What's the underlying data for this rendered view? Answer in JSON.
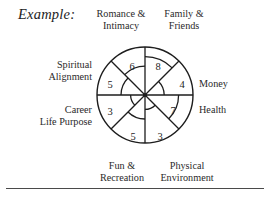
{
  "figure": {
    "caption_prefix": "Example:"
  },
  "chart_data": {
    "type": "pie",
    "subtype": "radar-wheel / life-balance wheel",
    "scale_min": 0,
    "scale_max": 10,
    "grid": false,
    "legend": "none",
    "categories": [
      "Family & Friends",
      "Money",
      "Health",
      "Physical Environment",
      "Fun & Recreation",
      "Career Life Purpose",
      "Spiritual Alignment",
      "Romance & Intimacy"
    ],
    "values": [
      8,
      4,
      7,
      3,
      5,
      3,
      5,
      6
    ],
    "segments": [
      {
        "id": "family-friends",
        "label": "Family &\nFriends",
        "label_line1": "Family &",
        "label_line2": "Friends",
        "value": 8,
        "value_text": "8",
        "start_deg": -90,
        "end_deg": -45
      },
      {
        "id": "money",
        "label": "Money",
        "label_line1": "Money",
        "label_line2": "",
        "value": 4,
        "value_text": "4",
        "start_deg": -45,
        "end_deg": 0
      },
      {
        "id": "health",
        "label": "Health",
        "label_line1": "Health",
        "label_line2": "",
        "value": 7,
        "value_text": "7",
        "start_deg": 0,
        "end_deg": 45
      },
      {
        "id": "physical-environment",
        "label": "Physical\nEnvironment",
        "label_line1": "Physical",
        "label_line2": "Environment",
        "value": 3,
        "value_text": "3",
        "start_deg": 45,
        "end_deg": 90
      },
      {
        "id": "fun-recreation",
        "label": "Fun &\nRecreation",
        "label_line1": "Fun &",
        "label_line2": "Recreation",
        "value": 5,
        "value_text": "5",
        "start_deg": 90,
        "end_deg": 135
      },
      {
        "id": "career-life-purpose",
        "label": "Career\nLife Purpose",
        "label_line1": "Career",
        "label_line2": "Life Purpose",
        "value": 3,
        "value_text": "3",
        "start_deg": 135,
        "end_deg": 180
      },
      {
        "id": "spiritual-alignment",
        "label": "Spiritual\nAlignment",
        "label_line1": "Spiritual",
        "label_line2": "Alignment",
        "value": 5,
        "value_text": "5",
        "start_deg": 180,
        "end_deg": 225
      },
      {
        "id": "romance-intimacy",
        "label": "Romance &\nIntimacy",
        "label_line1": "Romance &",
        "label_line2": "Intimacy",
        "value": 6,
        "value_text": "6",
        "start_deg": 225,
        "end_deg": 270
      }
    ],
    "xlabel": "",
    "ylabel": ""
  },
  "labels": {
    "romance_intimacy_l1": "Romance &",
    "romance_intimacy_l2": "Intimacy",
    "family_friends_l1": "Family &",
    "family_friends_l2": "Friends",
    "spiritual_alignment_l1": "Spiritual",
    "spiritual_alignment_l2": "Alignment",
    "money": "Money",
    "career_l1": "Career",
    "career_l2": "Life Purpose",
    "health": "Health",
    "fun_l1": "Fun &",
    "fun_l2": "Recreation",
    "physical_l1": "Physical",
    "physical_l2": "Environment"
  },
  "scores": {
    "romance_intimacy": "6",
    "family_friends": "8",
    "spiritual_alignment": "5",
    "money": "4",
    "career_life_purpose": "3",
    "health": "7",
    "fun_recreation": "5",
    "physical_environment": "3"
  },
  "colors": {
    "stroke": "#1d1d1d",
    "text": "#2a2a2a",
    "background": "#ffffff",
    "rule": "#4a4a4a"
  }
}
